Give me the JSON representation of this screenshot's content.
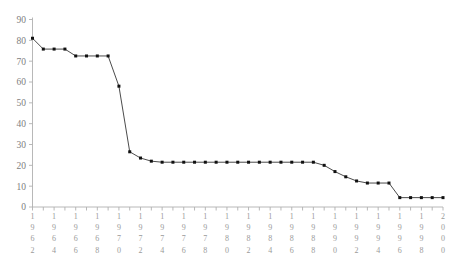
{
  "chart_data": {
    "type": "line",
    "title": "",
    "subtitle": "",
    "xlabel": "",
    "ylabel": "",
    "grid": false,
    "legend": false,
    "legend_position": "none",
    "marker": "filled-square",
    "line_color": "#2b2b2b",
    "marker_color": "#111111",
    "axis_color": "#b0b0b0",
    "tick_label_color": "#9a9a9a",
    "xlim": [
      1962,
      2000
    ],
    "ylim": [
      0,
      90
    ],
    "ytick_step": 10,
    "yticks": [
      0,
      10,
      20,
      30,
      40,
      50,
      60,
      70,
      80,
      90
    ],
    "ytick_labels": [
      "0",
      "10",
      "20",
      "30",
      "40",
      "50",
      "60",
      "70",
      "80",
      "90"
    ],
    "xtick_step": 1,
    "xtick_label_step": 2,
    "xtick_labels": [
      "1962",
      "1964",
      "1966",
      "1968",
      "1970",
      "1972",
      "1974",
      "1976",
      "1978",
      "1980",
      "1982",
      "1984",
      "1986",
      "1988",
      "1990",
      "1992",
      "1994",
      "1996",
      "1998",
      "2000"
    ],
    "x": [
      1962,
      1963,
      1964,
      1965,
      1966,
      1967,
      1968,
      1969,
      1970,
      1971,
      1972,
      1973,
      1974,
      1975,
      1976,
      1977,
      1978,
      1979,
      1980,
      1981,
      1982,
      1983,
      1984,
      1985,
      1986,
      1987,
      1988,
      1989,
      1990,
      1991,
      1992,
      1993,
      1994,
      1995,
      1996,
      1997,
      1998,
      1999,
      2000
    ],
    "values": [
      81.0,
      75.8,
      75.8,
      75.8,
      72.5,
      72.5,
      72.5,
      72.5,
      58.0,
      26.5,
      23.5,
      22.0,
      21.5,
      21.5,
      21.5,
      21.5,
      21.5,
      21.5,
      21.5,
      21.5,
      21.5,
      21.5,
      21.5,
      21.5,
      21.5,
      21.5,
      21.5,
      20.0,
      17.0,
      14.5,
      12.5,
      11.5,
      11.5,
      11.5,
      4.5,
      4.5,
      4.5,
      4.5,
      4.5
    ],
    "series": [
      {
        "name": "series-1",
        "values": [
          81.0,
          75.8,
          75.8,
          75.8,
          72.5,
          72.5,
          72.5,
          72.5,
          58.0,
          26.5,
          23.5,
          22.0,
          21.5,
          21.5,
          21.5,
          21.5,
          21.5,
          21.5,
          21.5,
          21.5,
          21.5,
          21.5,
          21.5,
          21.5,
          21.5,
          21.5,
          21.5,
          20.0,
          17.0,
          14.5,
          12.5,
          11.5,
          11.5,
          11.5,
          4.5,
          4.5,
          4.5,
          4.5,
          4.5
        ]
      }
    ],
    "annotations": []
  }
}
